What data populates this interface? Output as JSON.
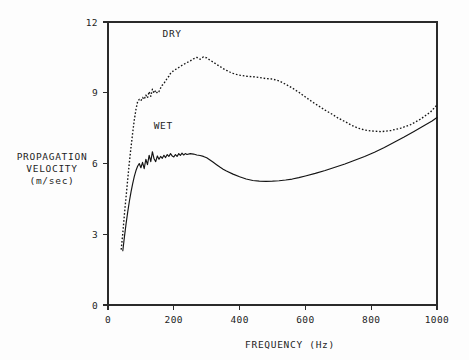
{
  "chart_data": {
    "type": "line",
    "title": "",
    "xlabel": "FREQUENCY (Hz)",
    "ylabel_lines": [
      "PROPAGATION",
      "VELOCITY",
      "(m/sec)"
    ],
    "ylabel": "PROPAGATION VELOCITY (m/sec)",
    "xlim": [
      0,
      1000
    ],
    "ylim": [
      0,
      12
    ],
    "xticks": [
      0,
      200,
      400,
      600,
      800,
      1000
    ],
    "xtick_labels": [
      "0",
      "200",
      "400",
      "600",
      "800",
      "1000"
    ],
    "yticks": [
      0,
      3,
      6,
      9,
      12
    ],
    "ytick_labels": [
      "0",
      "3",
      "6",
      "9",
      "12"
    ],
    "grid": false,
    "legend_position": "inline-annotations",
    "annotations": [
      {
        "text": "DRY",
        "x": 195,
        "y": 11.35
      },
      {
        "text": "WET",
        "x": 168,
        "y": 7.45
      }
    ],
    "series": [
      {
        "name": "DRY",
        "style": "dotted",
        "x": [
          40,
          45,
          50,
          55,
          60,
          65,
          70,
          75,
          80,
          85,
          90,
          95,
          100,
          105,
          110,
          115,
          120,
          125,
          130,
          135,
          140,
          145,
          150,
          155,
          160,
          165,
          170,
          175,
          180,
          185,
          190,
          195,
          200,
          210,
          220,
          230,
          240,
          250,
          260,
          270,
          280,
          290,
          300,
          310,
          320,
          330,
          340,
          350,
          360,
          370,
          380,
          390,
          400,
          420,
          440,
          460,
          480,
          500,
          520,
          540,
          560,
          580,
          600,
          620,
          640,
          660,
          680,
          700,
          720,
          740,
          760,
          780,
          800,
          830,
          860,
          890,
          920,
          950,
          980,
          1000
        ],
        "y": [
          2.35,
          3.05,
          3.85,
          4.6,
          5.35,
          6.05,
          6.7,
          7.3,
          7.85,
          8.3,
          8.62,
          8.72,
          8.66,
          8.8,
          8.72,
          8.9,
          8.78,
          9.05,
          8.85,
          9.15,
          8.98,
          9.1,
          8.98,
          9.05,
          9.2,
          9.32,
          9.4,
          9.5,
          9.62,
          9.7,
          9.82,
          9.88,
          9.95,
          10.02,
          10.12,
          10.2,
          10.28,
          10.35,
          10.44,
          10.5,
          10.42,
          10.52,
          10.48,
          10.38,
          10.3,
          10.2,
          10.12,
          10.02,
          9.95,
          9.88,
          9.82,
          9.78,
          9.75,
          9.7,
          9.68,
          9.65,
          9.6,
          9.58,
          9.5,
          9.36,
          9.2,
          9.02,
          8.82,
          8.62,
          8.44,
          8.26,
          8.1,
          7.92,
          7.78,
          7.62,
          7.5,
          7.42,
          7.38,
          7.35,
          7.4,
          7.5,
          7.65,
          7.88,
          8.18,
          8.48
        ]
      },
      {
        "name": "WET",
        "style": "solid",
        "x": [
          45,
          50,
          55,
          60,
          65,
          70,
          75,
          80,
          85,
          90,
          95,
          100,
          105,
          110,
          115,
          120,
          125,
          130,
          135,
          140,
          145,
          150,
          155,
          160,
          165,
          170,
          175,
          180,
          185,
          190,
          195,
          200,
          205,
          210,
          215,
          220,
          225,
          230,
          235,
          240,
          250,
          260,
          270,
          280,
          290,
          300,
          310,
          320,
          330,
          340,
          350,
          360,
          380,
          400,
          420,
          440,
          460,
          480,
          500,
          520,
          540,
          560,
          580,
          600,
          630,
          660,
          690,
          720,
          750,
          780,
          810,
          840,
          870,
          900,
          930,
          960,
          985,
          1000
        ],
        "y": [
          2.3,
          2.9,
          3.45,
          3.95,
          4.4,
          4.8,
          5.15,
          5.45,
          5.7,
          5.88,
          6.0,
          5.82,
          6.05,
          5.78,
          6.18,
          5.95,
          6.35,
          6.08,
          6.5,
          6.2,
          6.08,
          6.32,
          6.18,
          6.3,
          6.22,
          6.35,
          6.25,
          6.38,
          6.3,
          6.42,
          6.32,
          6.28,
          6.38,
          6.3,
          6.42,
          6.34,
          6.44,
          6.36,
          6.42,
          6.38,
          6.42,
          6.4,
          6.36,
          6.34,
          6.3,
          6.24,
          6.15,
          6.05,
          5.95,
          5.85,
          5.76,
          5.68,
          5.55,
          5.44,
          5.34,
          5.28,
          5.25,
          5.24,
          5.25,
          5.27,
          5.3,
          5.34,
          5.4,
          5.47,
          5.58,
          5.7,
          5.84,
          5.98,
          6.14,
          6.3,
          6.48,
          6.68,
          6.9,
          7.12,
          7.36,
          7.6,
          7.8,
          7.95
        ]
      }
    ]
  },
  "figure": {
    "background_color": "#fdfdfd",
    "ink_color": "#141414"
  }
}
